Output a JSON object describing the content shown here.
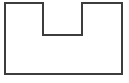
{
  "canvas": {
    "width": 129,
    "height": 83,
    "background_color": "#ffffff"
  },
  "figure": {
    "name": "h-shaped-outline",
    "stroke_color": "#3d3d3d",
    "fill_color": "#ffffff",
    "stroke_width": 2,
    "outer": {
      "left": 5,
      "top": 3,
      "right": 122,
      "bottom": 74
    },
    "notch": {
      "left": 43,
      "top": 3,
      "right": 82,
      "bottom": 35
    },
    "crossbar_y": 35,
    "left_pillar": {
      "left": 5,
      "right": 43
    },
    "right_pillar": {
      "left": 82,
      "right": 122
    },
    "path_points": [
      [
        5,
        3
      ],
      [
        43,
        3
      ],
      [
        43,
        35
      ],
      [
        82,
        35
      ],
      [
        82,
        3
      ],
      [
        122,
        3
      ],
      [
        122,
        74
      ],
      [
        5,
        74
      ]
    ]
  }
}
